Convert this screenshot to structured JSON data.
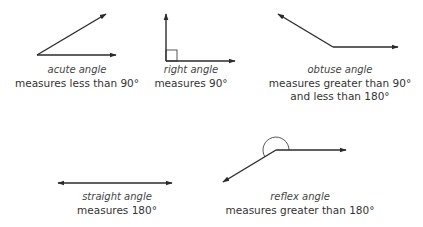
{
  "colors": {
    "line": "#2b2b2b",
    "text": "#333333"
  },
  "angles": [
    {
      "id": "acute",
      "name": "acute angle",
      "desc_lines": [
        "measures less than 90°"
      ]
    },
    {
      "id": "right",
      "name": "right angle",
      "desc_lines": [
        "measures 90°"
      ]
    },
    {
      "id": "obtuse",
      "name": "obtuse angle",
      "desc_lines": [
        "measures greater than 90°",
        "and less than 180°"
      ]
    },
    {
      "id": "straight",
      "name": "straight angle",
      "desc_lines": [
        "measures 180°"
      ]
    },
    {
      "id": "reflex",
      "name": "reflex angle",
      "desc_lines": [
        "measures greater than 180°"
      ]
    }
  ]
}
